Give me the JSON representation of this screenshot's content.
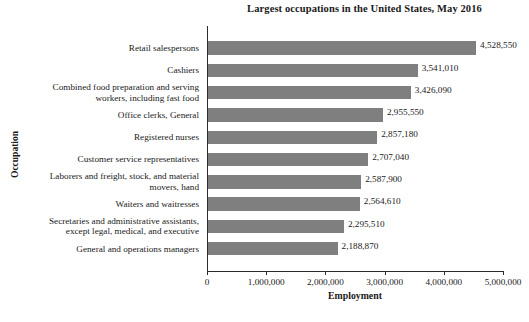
{
  "chart_data": {
    "type": "bar",
    "orientation": "horizontal",
    "title": "Largest occupations in the United States, May 2016",
    "xlabel": "Employment",
    "ylabel": "Occupation",
    "xlim": [
      0,
      5000000
    ],
    "grid": false,
    "legend": null,
    "bar_color": "#7f7f7f",
    "axis_color": "#2b2b2b",
    "xticks": [
      {
        "value": 0,
        "label": "0"
      },
      {
        "value": 1000000,
        "label": "1,000,000"
      },
      {
        "value": 2000000,
        "label": "2,000,000"
      },
      {
        "value": 3000000,
        "label": "3,000,000"
      },
      {
        "value": 4000000,
        "label": "4,000,000"
      },
      {
        "value": 5000000,
        "label": "5,000,000"
      }
    ],
    "categories": [
      "Retail salespersons",
      "Cashiers",
      "Combined food preparation and serving workers, including fast food",
      "Office clerks, General",
      "Registered nurses",
      "Customer service representatives",
      "Laborers and freight, stock, and material movers, hand",
      "Waiters and waitresses",
      "Secretaries and administrative assistants, except legal, medical, and executive",
      "General and operations managers"
    ],
    "category_lines": [
      [
        "Retail salespersons"
      ],
      [
        "Cashiers"
      ],
      [
        "Combined food preparation and serving",
        "workers, including fast food"
      ],
      [
        "Office clerks, General"
      ],
      [
        "Registered nurses"
      ],
      [
        "Customer service representatives"
      ],
      [
        "Laborers and freight, stock, and material",
        "movers, hand"
      ],
      [
        "Waiters and waitresses"
      ],
      [
        "Secretaries and administrative assistants,",
        "except legal, medical, and executive"
      ],
      [
        "General and operations managers"
      ]
    ],
    "values": [
      4528550,
      3541010,
      3426090,
      2955550,
      2857180,
      2707040,
      2587900,
      2564610,
      2295510,
      2188870
    ],
    "value_labels": [
      "4,528,550",
      "3,541,010",
      "3,426,090",
      "2,955,550",
      "2,857,180",
      "2,707,040",
      "2,587,900",
      "2,564,610",
      "2,295,510",
      "2,188,870"
    ]
  },
  "caption": {
    "text": ""
  }
}
